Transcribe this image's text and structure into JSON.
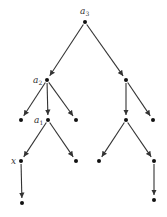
{
  "diagram": {
    "type": "directed-tree",
    "nodes": [
      {
        "id": "n0",
        "x": 85,
        "y": 22,
        "label": "a",
        "sub": "3"
      },
      {
        "id": "n1",
        "x": 47,
        "y": 80,
        "label": "a",
        "sub": "2"
      },
      {
        "id": "n2",
        "x": 126,
        "y": 80,
        "label": ""
      },
      {
        "id": "n3",
        "x": 21,
        "y": 120,
        "label": ""
      },
      {
        "id": "n4",
        "x": 48,
        "y": 120,
        "label": "a",
        "sub": "1"
      },
      {
        "id": "n5",
        "x": 76,
        "y": 120,
        "label": ""
      },
      {
        "id": "n6",
        "x": 126,
        "y": 120,
        "label": ""
      },
      {
        "id": "n7",
        "x": 153,
        "y": 120,
        "label": ""
      },
      {
        "id": "n8",
        "x": 21,
        "y": 161,
        "label": "x",
        "sub": ""
      },
      {
        "id": "n9",
        "x": 76,
        "y": 161,
        "label": ""
      },
      {
        "id": "n10",
        "x": 99,
        "y": 161,
        "label": ""
      },
      {
        "id": "n11",
        "x": 154,
        "y": 161,
        "label": ""
      },
      {
        "id": "n12",
        "x": 22,
        "y": 203,
        "label": ""
      },
      {
        "id": "n13",
        "x": 154,
        "y": 200,
        "label": ""
      }
    ],
    "edges": [
      [
        "n0",
        "n1"
      ],
      [
        "n0",
        "n2"
      ],
      [
        "n1",
        "n3"
      ],
      [
        "n1",
        "n4"
      ],
      [
        "n1",
        "n5"
      ],
      [
        "n2",
        "n6"
      ],
      [
        "n2",
        "n7"
      ],
      [
        "n4",
        "n8"
      ],
      [
        "n4",
        "n9"
      ],
      [
        "n6",
        "n10"
      ],
      [
        "n6",
        "n11"
      ],
      [
        "n8",
        "n12"
      ],
      [
        "n11",
        "n13"
      ]
    ],
    "colors": {
      "edge": "#333333",
      "node": "#111111"
    }
  }
}
